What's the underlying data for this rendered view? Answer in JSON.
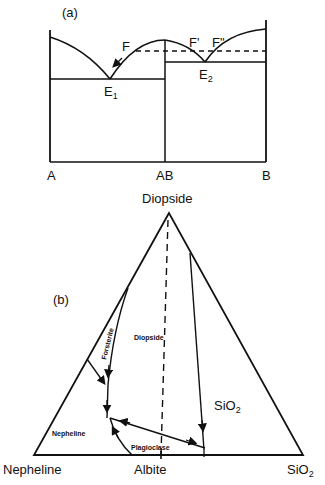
{
  "panel_a": {
    "label": "(a)",
    "points": {
      "F": "F",
      "F_prime": "F'",
      "F_double_prime": "F\"",
      "E1": "E",
      "E1_sub": "1",
      "E2": "E",
      "E2_sub": "2"
    },
    "axis_labels": {
      "left": "A",
      "middle": "AB",
      "right": "B"
    }
  },
  "panel_b": {
    "label": "(b)",
    "apex_label": "Diopside",
    "base_left_label": "Nepheline",
    "base_middle_label": "Albite",
    "base_right_label": "SiO",
    "base_right_sub": "2",
    "fields": {
      "diopside": "Diopside",
      "forsterite": "Forsterite",
      "nepheline": "Nepheline",
      "plagioclase": "Plagioclase",
      "silica": "SiO",
      "silica_sub": "2"
    }
  },
  "colors": {
    "line": "#111111",
    "background": "#ffffff"
  }
}
